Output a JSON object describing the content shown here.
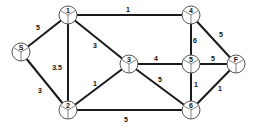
{
  "diagram": {
    "type": "weighted-undirected-graph",
    "node_radius": 9,
    "nodes": [
      {
        "id": "1",
        "label": "1",
        "x": 68,
        "y": 15
      },
      {
        "id": "S",
        "label": "S",
        "x": 21,
        "y": 52
      },
      {
        "id": "2",
        "label": "2",
        "x": 68,
        "y": 110
      },
      {
        "id": "3",
        "label": "3",
        "x": 129,
        "y": 64
      },
      {
        "id": "4",
        "label": "4",
        "x": 191,
        "y": 15
      },
      {
        "id": "5",
        "label": "5",
        "x": 191,
        "y": 64
      },
      {
        "id": "F",
        "label": "F",
        "x": 236,
        "y": 64
      },
      {
        "id": "6",
        "label": "6",
        "x": 191,
        "y": 110
      }
    ],
    "edges": [
      {
        "from": "S",
        "to": "1",
        "weight": "5",
        "lx": 38,
        "ly": 30
      },
      {
        "from": "S",
        "to": "2",
        "weight": "3",
        "lx": 40,
        "ly": 93
      },
      {
        "from": "1",
        "to": "2",
        "weight": "3.5",
        "lx": 57,
        "ly": 70
      },
      {
        "from": "1",
        "to": "3",
        "weight": "3",
        "lx": 95,
        "ly": 48
      },
      {
        "from": "1",
        "to": "4",
        "weight": "1",
        "lx": 128,
        "ly": 12
      },
      {
        "from": "2",
        "to": "3",
        "weight": "1",
        "lx": 95,
        "ly": 86
      },
      {
        "from": "2",
        "to": "6",
        "weight": "5",
        "lx": 126,
        "ly": 122
      },
      {
        "from": "3",
        "to": "5",
        "weight": "4",
        "lx": 156,
        "ly": 61
      },
      {
        "from": "3",
        "to": "6",
        "weight": "5",
        "lx": 160,
        "ly": 82
      },
      {
        "from": "4",
        "to": "5",
        "weight": "6",
        "lx": 195,
        "ly": 43
      },
      {
        "from": "4",
        "to": "F",
        "weight": "5",
        "lx": 221,
        "ly": 37
      },
      {
        "from": "5",
        "to": "F",
        "weight": "5",
        "lx": 213,
        "ly": 61
      },
      {
        "from": "5",
        "to": "6",
        "weight": "1",
        "lx": 196,
        "ly": 87
      },
      {
        "from": "6",
        "to": "F",
        "weight": "1",
        "lx": 220,
        "ly": 91
      }
    ],
    "colors": {
      "edge": "#1a1a1a",
      "node_fill": "#ffffff",
      "node_stroke": "#555555",
      "text": "#111111"
    }
  }
}
